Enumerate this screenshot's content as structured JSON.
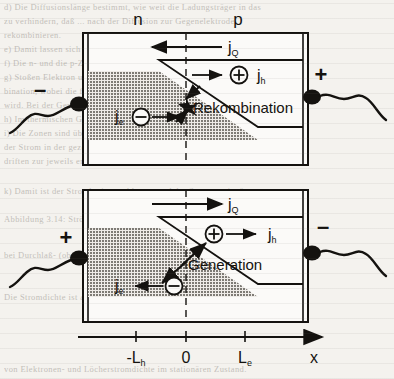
{
  "figure": {
    "colors": {
      "ink": "#14120f",
      "paper": "#f4f2ee",
      "shade_gray": "#8f8c86",
      "ghost_text": "#9a958e"
    }
  },
  "region_labels": {
    "n_side": "n",
    "p_side": "p"
  },
  "upper_panel": {
    "name": "recombination-panel",
    "terminal_left": "–",
    "terminal_right": "+",
    "total_current_label": "j",
    "total_current_sub": "Q",
    "total_current_direction": "left",
    "hole_current_label": "j",
    "hole_current_sub": "h",
    "hole_current_direction": "right",
    "hole_symbol": "+",
    "electron_current_label": "j",
    "electron_current_sub": "e",
    "electron_current_direction": "right",
    "electron_symbol": "–",
    "process_label": "Rekombination"
  },
  "lower_panel": {
    "name": "generation-panel",
    "terminal_left": "+",
    "terminal_right": "–",
    "total_current_label": "j",
    "total_current_sub": "Q",
    "total_current_direction": "right",
    "hole_current_label": "j",
    "hole_current_sub": "h",
    "hole_current_direction": "right",
    "hole_symbol": "+",
    "electron_current_label": "j",
    "electron_current_sub": "e",
    "electron_current_direction": "left",
    "electron_symbol": "–",
    "process_label": "Generation"
  },
  "axis": {
    "name": "x-axis",
    "ticks": [
      {
        "label": "-L",
        "sub": "h",
        "x": 136
      },
      {
        "label": "0",
        "sub": "",
        "x": 186
      },
      {
        "label": "L",
        "sub": "e",
        "x": 245
      }
    ],
    "axis_label": "x"
  },
  "background_text": {
    "lines": [
      "d) Die Diffusionslänge bestimmt, wie weit die Ladungsträger in das",
      "zu verhindern, daß  ...  nach der Diffusion zur Gegenelektrode",
      "rekombinieren.",
      "e) Damit lassen sich die Ströme jQ, jh, jn an jeder Stelle  ermitteln,",
      "f) Die n- und die p-Zone sind so bemessen, daß eine Diffusion bis zur",
      "g) Stoßen Elektron und Loch zusammen, so kommt es zur Rekom-",
      "bination, wobei die freiwerdende Energie an das Gitter abgegeben",
      "wird. Bei der Generation geschieht der umgekehrte Vorgang.",
      "h) Im thermischen Gleichgewicht heben sich beide Raten auf.",
      "i) Die Zonen sind über die Kontakte an die Spannung gelegt, so daß",
      "der Strom in der gezeigten Richtung fließt. Die Ladungsträger",
      "driften zur jeweils entgegengesetzt geladenen Elektrode hin.",
      "k) Damit ist der Stromkreis geschlossen und der Strom stationär.",
      "Abbildung 3.14: Ströme und Ladungsträgerbewegung im pn-Übergang",
      "bei Durchlaß- (oben) und Sperrichtung (unten) der Diode."
    ]
  }
}
